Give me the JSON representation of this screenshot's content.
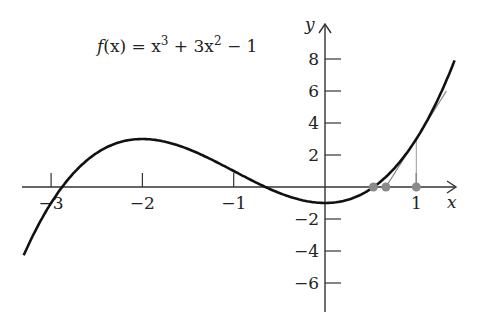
{
  "chart_data": {
    "type": "line",
    "title_parts": {
      "lhs": "f",
      "arg": "(x)",
      "eq": " = x",
      "sup1": "3",
      "mid": " + 3x",
      "sup2": "2",
      "tail": " − 1"
    },
    "xlabel": "x",
    "ylabel": "y",
    "xlim": [
      -3.3,
      1.42
    ],
    "ylim": [
      -6.5,
      8.5
    ],
    "x_ticks": [
      -3,
      -2,
      -1,
      1
    ],
    "x_tick_labels": [
      "−3",
      "−2",
      "−1",
      "1"
    ],
    "y_ticks": [
      8,
      6,
      4,
      2,
      -2,
      -4,
      -6
    ],
    "y_tick_labels": [
      "8",
      "6",
      "4",
      "2",
      "−2",
      "−4",
      "−6"
    ],
    "grid": false,
    "series": [
      {
        "name": "f(x) = x^3 + 3x^2 - 1",
        "color": "#111111",
        "x": [
          -3.3,
          -3,
          -2.5,
          -2,
          -1.5,
          -1,
          -0.5,
          0,
          0.5,
          1,
          1.42
        ],
        "y": [
          -4.27,
          -1,
          2.13,
          3,
          2.38,
          1,
          -0.38,
          -1,
          -0.13,
          3,
          7.91
        ]
      },
      {
        "name": "tangent at x=1 (Newton step)",
        "color": "#888888",
        "x": [
          0.667,
          1.33
        ],
        "y": [
          0,
          6.0
        ]
      }
    ],
    "annotations": [
      {
        "type": "vertical-line",
        "x": 1,
        "y_from": 0,
        "y_to": 3,
        "color": "#999999"
      },
      {
        "type": "points",
        "color": "#888888",
        "x": [
          0.53,
          0.667,
          1
        ],
        "y": [
          0,
          0,
          0
        ]
      }
    ]
  },
  "colors": {
    "curve": "#111111",
    "tangent": "#8a8a8a",
    "axis": "#333333",
    "marker": "#8a8a8a"
  }
}
